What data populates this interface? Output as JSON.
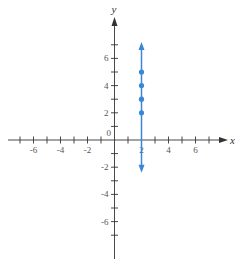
{
  "chart_data": {
    "type": "scatter",
    "title": "",
    "xlabel": "x",
    "ylabel": "y",
    "xlim": [
      -8,
      8
    ],
    "ylim": [
      -9,
      9
    ],
    "x_ticks": [
      -7,
      -6,
      -5,
      -4,
      -3,
      -2,
      -1,
      1,
      2,
      3,
      4,
      5,
      6,
      7
    ],
    "y_ticks": [
      -7,
      -6,
      -5,
      -4,
      -3,
      -2,
      -1,
      1,
      2,
      3,
      4,
      5,
      6,
      7
    ],
    "x_tick_labels": [
      "-6",
      "-4",
      "-2",
      "2",
      "4",
      "6"
    ],
    "x_tick_label_values": [
      -6,
      -4,
      -2,
      2,
      4,
      6
    ],
    "y_tick_labels": [
      "6",
      "4",
      "2",
      "-2",
      "-4",
      "-6"
    ],
    "y_tick_label_values": [
      6,
      4,
      2,
      -2,
      -4,
      -6
    ],
    "origin_label": "0",
    "grid": false,
    "series": [
      {
        "name": "vertical line x = 2",
        "kind": "line",
        "x": [
          2,
          2
        ],
        "y": [
          -2.4,
          7.2
        ],
        "arrows": "both",
        "color": "#3a87d4"
      },
      {
        "name": "points",
        "kind": "points",
        "x": [
          2,
          2,
          2,
          2
        ],
        "y": [
          2,
          3,
          4,
          5
        ],
        "color": "#3a87d4"
      }
    ],
    "axis_color": "#333333"
  }
}
